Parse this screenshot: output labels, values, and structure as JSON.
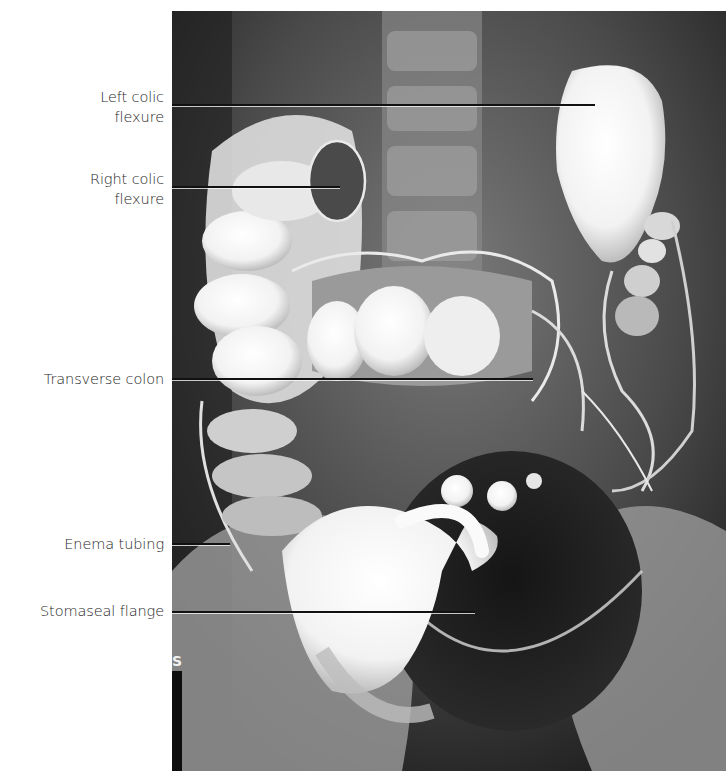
{
  "figure": {
    "type": "barium enema radiograph",
    "labels": [
      {
        "id": "left-colic-flexure",
        "line1": "Left colic",
        "line2": "flexure",
        "label_top": 87,
        "line_y": 105,
        "line_x_end": 595
      },
      {
        "id": "right-colic-flexure",
        "line1": "Right colic",
        "line2": "flexure",
        "label_top": 169,
        "line_y": 187,
        "line_x_end": 340
      },
      {
        "id": "transverse-colon",
        "line1": "Transverse colon",
        "line2": "",
        "label_top": 369,
        "line_y": 379,
        "line_x_end": 533
      },
      {
        "id": "enema-tubing",
        "line1": "Enema tubing",
        "line2": "",
        "label_top": 534,
        "line_y": 544,
        "line_x_end": 230
      },
      {
        "id": "stomaseal-flange",
        "line1": "Stomaseal flange",
        "line2": "",
        "label_top": 601,
        "line_y": 612,
        "line_x_end": 475
      }
    ],
    "film_marker": "S"
  }
}
